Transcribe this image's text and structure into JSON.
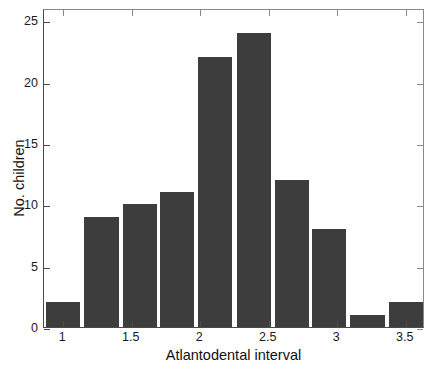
{
  "chart_data": {
    "type": "bar",
    "title": "",
    "subtitle": "",
    "xlabel": "Atlantodental interval",
    "ylabel": "No. children",
    "categories": [
      "1",
      "1.28",
      "1.56",
      "1.83",
      "2.11",
      "2.39",
      "2.67",
      "2.94",
      "3.22",
      "3.5"
    ],
    "values": [
      2,
      9,
      10,
      11,
      22,
      24,
      12,
      8,
      1,
      2
    ],
    "x": [
      1.0,
      1.28,
      1.56,
      1.83,
      2.11,
      2.39,
      2.67,
      2.94,
      3.22,
      3.5
    ],
    "bar_color": "#3d3d3d",
    "bar_edge_color": "#3d3d3d",
    "xlim": [
      0.86,
      3.64
    ],
    "ylim": [
      0,
      26
    ],
    "xticks": [
      1,
      1.5,
      2,
      2.5,
      3,
      3.5
    ],
    "xticklabels": [
      "1",
      "1.5",
      "2",
      "2.5",
      "3",
      "3.5"
    ],
    "yticks": [
      0,
      5,
      10,
      15,
      20,
      25
    ],
    "yticklabels": [
      "0",
      "5",
      "10",
      "15",
      "20",
      "25"
    ],
    "grid": false,
    "legend": null,
    "legend_position": "none",
    "annotations": [],
    "background_color": "#ffffff",
    "axis_color": "#4a4a4a"
  }
}
